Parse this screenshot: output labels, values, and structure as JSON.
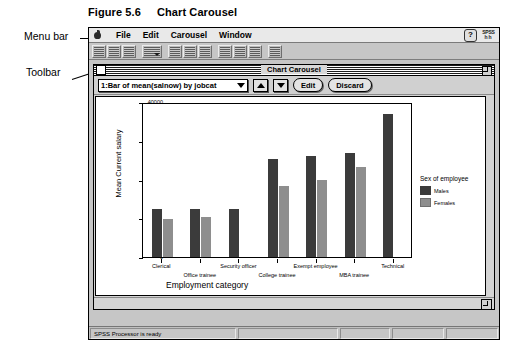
{
  "figure": {
    "number": "Figure 5.6",
    "caption": "Chart Carousel"
  },
  "callouts": {
    "menu_bar": "Menu bar",
    "toolbar": "Toolbar"
  },
  "menu_bar": {
    "apple_icon": "apple-icon",
    "items": [
      {
        "label": "File"
      },
      {
        "label": "Edit"
      },
      {
        "label": "Carousel"
      },
      {
        "label": "Window"
      }
    ],
    "help_icon_label": "?",
    "logo_line1": "SPSS",
    "logo_line2": "hh"
  },
  "toolbar": {
    "groups": [
      {
        "buttons": [
          {
            "icon": "open-file-icon",
            "has_caret": false,
            "wide": false
          },
          {
            "icon": "save-file-icon",
            "has_caret": false,
            "wide": false
          },
          {
            "icon": "print-icon",
            "has_caret": false,
            "wide": false
          }
        ]
      },
      {
        "buttons": [
          {
            "icon": "recall-dialog-icon",
            "has_caret": true,
            "wide": true
          }
        ]
      },
      {
        "buttons": [
          {
            "icon": "goto-case-icon",
            "has_caret": false,
            "wide": false
          },
          {
            "icon": "variables-icon",
            "has_caret": false,
            "wide": false
          },
          {
            "icon": "find-icon",
            "has_caret": false,
            "wide": false
          }
        ]
      },
      {
        "buttons": [
          {
            "icon": "insert-case-icon",
            "has_caret": false,
            "wide": false
          },
          {
            "icon": "insert-variable-icon",
            "has_caret": false,
            "wide": false
          },
          {
            "icon": "split-file-icon",
            "has_caret": false,
            "wide": false
          }
        ]
      },
      {
        "buttons": [
          {
            "icon": "help-tool-icon",
            "has_caret": false,
            "wide": false
          }
        ]
      }
    ]
  },
  "chart_window": {
    "title": "Chart Carousel",
    "close_box": "close-box",
    "zoom_box": "zoom-box",
    "grow_box": "grow-box",
    "controls": {
      "selected_chart": "1:Bar of mean(salnow) by jobcat",
      "prev_label": "previous-chart",
      "next_label": "next-chart",
      "edit_label": "Edit",
      "discard_label": "Discard"
    }
  },
  "status_bar": {
    "message": "SPSS Processor is ready"
  },
  "chart_data": {
    "type": "bar",
    "title": "",
    "xlabel": "Employment category",
    "ylabel": "Mean Current salary",
    "ylim": [
      0,
      40000
    ],
    "yticks": [
      0,
      10000,
      20000,
      30000,
      40000
    ],
    "ytick_labels": [
      "0",
      "10000",
      "20000",
      "30000",
      "40000"
    ],
    "grid": false,
    "legend_title": "Sex of employee",
    "legend_position": "right",
    "categories": [
      "Clerical",
      "Office trainee",
      "Security officer",
      "College trainee",
      "Exempt employee",
      "MBA trainee",
      "Technical"
    ],
    "category_label_rows": [
      {
        "row": 1,
        "labels": [
          "Clerical",
          "Security officer",
          "Exempt employee",
          "Technical"
        ]
      },
      {
        "row": 2,
        "labels": [
          "Office trainee",
          "College trainee",
          "MBA trainee"
        ]
      }
    ],
    "series": [
      {
        "name": "Males",
        "color": "#3b3b3b",
        "values": [
          12500,
          12500,
          12300,
          25400,
          26100,
          26900,
          37000
        ]
      },
      {
        "name": "Females",
        "color": "#8e8e8e",
        "values": [
          9700,
          10200,
          null,
          18200,
          20000,
          23300,
          null
        ]
      }
    ]
  }
}
